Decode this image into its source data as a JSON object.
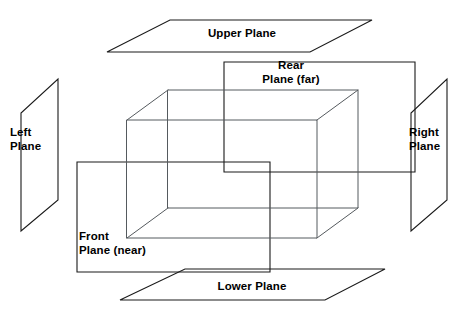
{
  "diagram": {
    "background_color": "#ffffff",
    "outline_color": "#1a1a1a",
    "box_edge_color": "#555a5e",
    "labels": {
      "upper_plane": "Upper Plane",
      "lower_plane": "Lower Plane",
      "left_plane": "Left\nPlane",
      "right_plane": "Right\nPlane",
      "rear_plane": "Rear\nPlane (far)",
      "front_plane": "Front\nPlane (near)"
    },
    "shapes": {
      "upper_plane": {
        "name": "Upper Plane",
        "type": "parallelogram",
        "points": "170,20 372,20 310,52 107,52"
      },
      "lower_plane": {
        "name": "Lower Plane",
        "type": "parallelogram",
        "points": "185,269 385,269 325,300 120,300"
      },
      "left_plane": {
        "name": "Left Plane",
        "type": "parallelogram",
        "points": "58,79 58,200 21,231 21,113"
      },
      "right_plane": {
        "name": "Right Plane",
        "type": "parallelogram",
        "points": "447,79 447,200 411,231 411,113"
      },
      "rear_plane": {
        "name": "Rear Plane (far)",
        "type": "rectangle",
        "points": "224,62 415,62 415,172 224,172"
      },
      "front_plane": {
        "name": "Front Plane (near)",
        "type": "rectangle",
        "points": "77,162 270,162 270,272 77,272"
      },
      "view_box": {
        "name": "View volume box",
        "type": "cuboid",
        "front_face": "127,120 317,120 317,238 127,238",
        "back_face": "168,90 358,90 358,208 168,208",
        "connectors": [
          "127,120 168,90",
          "317,120 358,90",
          "127,238 168,208",
          "317,238 358,208"
        ]
      }
    }
  }
}
